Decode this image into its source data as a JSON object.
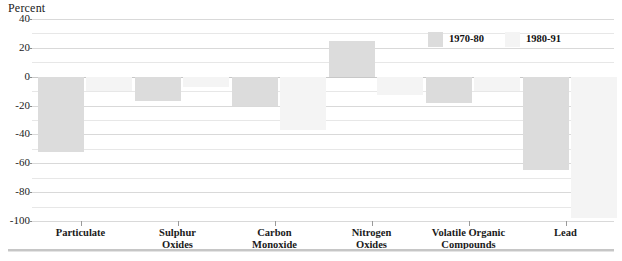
{
  "chart_data": {
    "type": "bar",
    "title": "",
    "ylabel": "Percent",
    "xlabel": "",
    "ylim": [
      -100,
      40
    ],
    "yticks": [
      40,
      20,
      0,
      -20,
      -40,
      -60,
      -80,
      -100
    ],
    "ytick_labels": [
      "40",
      "20",
      "0",
      "-20",
      "-40",
      "-60",
      "-80",
      "-100"
    ],
    "minor_gridlines": [
      30,
      10,
      -10,
      -30,
      -50,
      -70,
      -90
    ],
    "grid": true,
    "legend_position": "top-right",
    "categories": [
      "Particulate",
      "Sulphur Oxides",
      "Carbon Monoxide",
      "Nitrogen Oxides",
      "Volatile Organic Compounds",
      "Lead"
    ],
    "category_lines": [
      [
        "Particulate"
      ],
      [
        "Sulphur",
        "Oxides"
      ],
      [
        "Carbon",
        "Monoxide"
      ],
      [
        "Nitrogen",
        "Oxides"
      ],
      [
        "Volatile Organic",
        "Compounds"
      ],
      [
        "Lead"
      ]
    ],
    "series": [
      {
        "name": "1970-80",
        "color": "#dcdcdc",
        "values": [
          -52,
          -17,
          -20,
          25,
          -18,
          -65
        ]
      },
      {
        "name": "1980-91",
        "color": "#f4f4f4",
        "values": [
          -10,
          -7,
          -37,
          -13,
          -10,
          -98
        ]
      }
    ]
  },
  "legend": {
    "items": [
      {
        "label": "1970-80"
      },
      {
        "label": "1980-91"
      }
    ]
  },
  "colors": {
    "series_1970_80": "#dcdcdc",
    "series_1980_91": "#f4f4f4",
    "gridline": "#d9d9d9",
    "text": "#1a1a1a"
  }
}
